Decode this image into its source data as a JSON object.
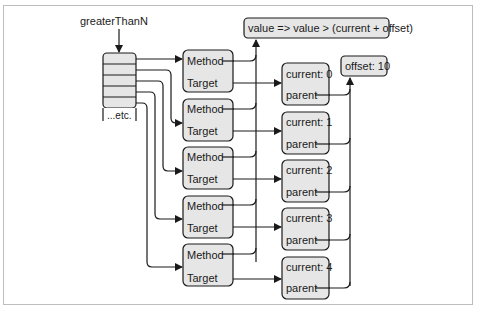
{
  "diagram": {
    "variable_label": "greaterThanN",
    "array_more_label": "...etc.",
    "function_text": "value => value > (current + offset)",
    "offset_label": "offset: 10",
    "delegates": [
      {
        "method": "Method",
        "target": "Target"
      },
      {
        "method": "Method",
        "target": "Target"
      },
      {
        "method": "Method",
        "target": "Target"
      },
      {
        "method": "Method",
        "target": "Target"
      },
      {
        "method": "Method",
        "target": "Target"
      }
    ],
    "closures": [
      {
        "current": "current: 0",
        "parent": "parent"
      },
      {
        "current": "current: 1",
        "parent": "parent"
      },
      {
        "current": "current: 2",
        "parent": "parent"
      },
      {
        "current": "current: 3",
        "parent": "parent"
      },
      {
        "current": "current: 4",
        "parent": "parent"
      }
    ],
    "colors": {
      "box_fill": "#e6e6e6",
      "stroke": "#1a1a1a",
      "frame": "#bdbdbd"
    }
  }
}
